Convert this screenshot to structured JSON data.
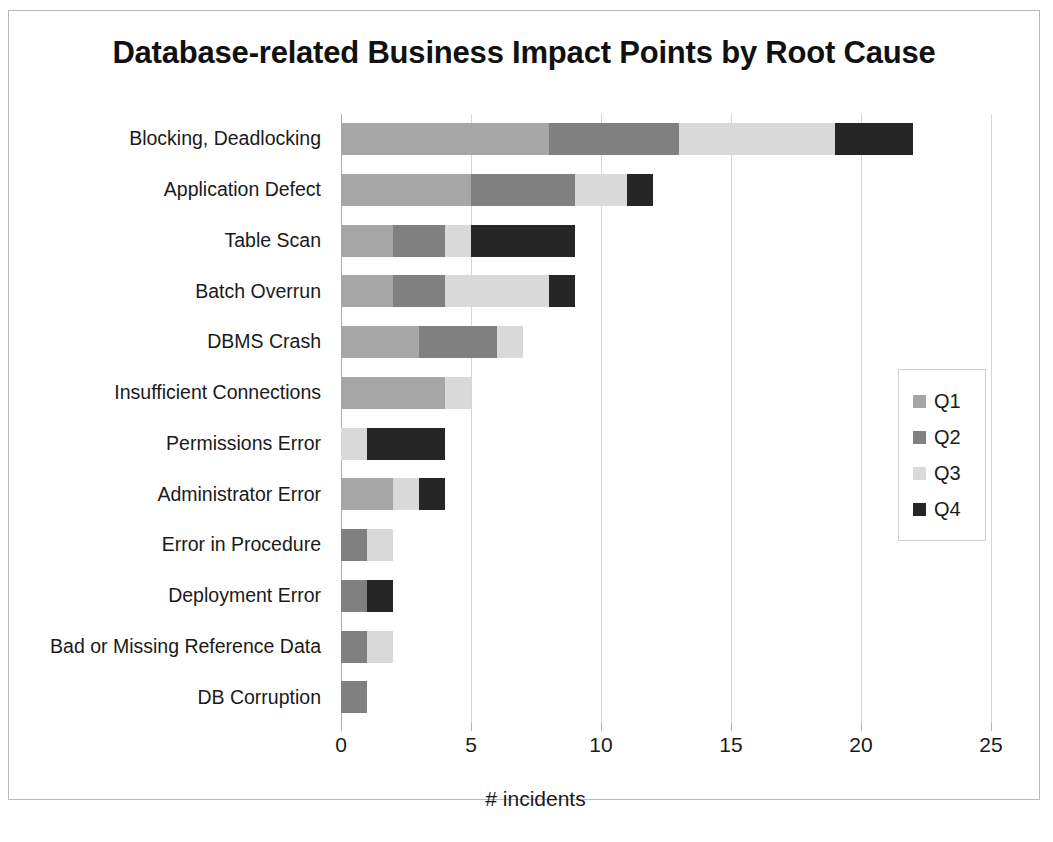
{
  "chart_data": {
    "type": "bar",
    "orientation": "horizontal",
    "stacked": true,
    "title": "Database-related Business Impact Points by Root Cause",
    "xlabel": "# incidents",
    "ylabel": "",
    "xlim": [
      0,
      25
    ],
    "xticks": [
      0,
      5,
      10,
      15,
      20,
      25
    ],
    "xtick_labels": [
      "0",
      "5",
      "10",
      "15",
      "20",
      "25"
    ],
    "grid": true,
    "legend_position": "right",
    "categories": [
      "Blocking, Deadlocking",
      "Application Defect",
      "Table Scan",
      "Batch Overrun",
      "DBMS Crash",
      "Insufficient Connections",
      "Permissions Error",
      "Administrator Error",
      "Error in Procedure",
      "Deployment Error",
      "Bad or Missing Reference Data",
      "DB Corruption"
    ],
    "series": [
      {
        "name": "Q1",
        "color": "#a6a6a6",
        "values": [
          8,
          5,
          2,
          2,
          3,
          4,
          0,
          2,
          0,
          0,
          0,
          0
        ]
      },
      {
        "name": "Q2",
        "color": "#808080",
        "values": [
          5,
          4,
          2,
          2,
          3,
          0,
          0,
          0,
          1,
          1,
          1,
          1
        ]
      },
      {
        "name": "Q3",
        "color": "#d9d9d9",
        "values": [
          6,
          2,
          1,
          4,
          1,
          1,
          1,
          1,
          1,
          0,
          1,
          0
        ]
      },
      {
        "name": "Q4",
        "color": "#262626",
        "values": [
          3,
          1,
          4,
          1,
          0,
          0,
          3,
          1,
          0,
          1,
          0,
          0
        ]
      }
    ],
    "totals": [
      22,
      12,
      9,
      9,
      7,
      5,
      4,
      4,
      2,
      2,
      2,
      1
    ]
  },
  "legend": {
    "items": [
      {
        "label": "Q1",
        "color": "#a6a6a6"
      },
      {
        "label": "Q2",
        "color": "#808080"
      },
      {
        "label": "Q3",
        "color": "#d9d9d9"
      },
      {
        "label": "Q4",
        "color": "#262626"
      }
    ]
  },
  "artifact": {
    "text": ""
  }
}
